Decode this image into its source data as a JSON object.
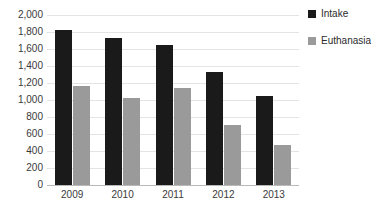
{
  "chart_data": {
    "type": "bar",
    "title": "",
    "xlabel": "",
    "ylabel": "",
    "categories": [
      "2009",
      "2010",
      "2011",
      "2012",
      "2013"
    ],
    "series": [
      {
        "name": "Intake",
        "color": "#1a1a1a",
        "values": [
          1824,
          1730,
          1647,
          1329,
          1047
        ]
      },
      {
        "name": "Euthanasia",
        "color": "#9a9a9a",
        "values": [
          1165,
          1024,
          1141,
          706,
          471
        ]
      }
    ],
    "ylim": [
      0,
      2000
    ],
    "ytick_step": 200,
    "ytick_labels": [
      "2,000",
      "1,800",
      "1,600",
      "1,400",
      "1,200",
      "1,000",
      "800",
      "600",
      "400",
      "200",
      "0"
    ],
    "ytick_values": [
      2000,
      1800,
      1600,
      1400,
      1200,
      1000,
      800,
      600,
      400,
      200,
      0
    ],
    "grid": true,
    "legend_position": "right"
  },
  "legend": {
    "items": [
      {
        "label": "Intake",
        "color": "#1a1a1a"
      },
      {
        "label": "Euthanasia",
        "color": "#9a9a9a"
      }
    ]
  },
  "title_sliver": {
    "text": "."
  }
}
